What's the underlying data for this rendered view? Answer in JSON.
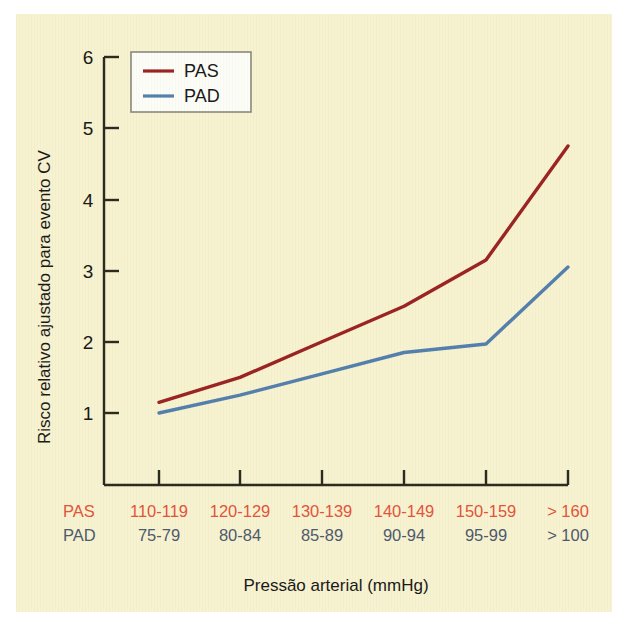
{
  "chart_data": {
    "type": "line",
    "title": "",
    "xlabel": "Pressão arterial (mmHg)",
    "ylabel": "Risco relativo ajustado para evento CV",
    "categories": [
      "110-119",
      "120-129",
      "130-139",
      "140-149",
      "150-159",
      "> 160"
    ],
    "categories_secondary": [
      "75-79",
      "80-84",
      "85-89",
      "90-94",
      "95-99",
      "> 100"
    ],
    "category_row_labels": {
      "primary": "PAS",
      "secondary": "PAD"
    },
    "series": [
      {
        "name": "PAS",
        "color": "#9B2424",
        "values": [
          1.15,
          1.5,
          2.0,
          2.5,
          3.15,
          4.75
        ]
      },
      {
        "name": "PAD",
        "color": "#5580AE",
        "values": [
          1.0,
          1.25,
          1.55,
          1.85,
          1.97,
          3.05
        ]
      }
    ],
    "yticks": [
      1,
      2,
      3,
      4,
      5,
      6
    ],
    "ytick_labels": [
      "1",
      "2",
      "3",
      "4",
      "5",
      "6"
    ],
    "ylim": [
      0.0,
      6.0
    ],
    "grid": false,
    "legend_position": "top-left",
    "legend_entries": [
      "PAS",
      "PAD"
    ]
  },
  "axis": {
    "y_tick_1": "1",
    "y_tick_2": "2",
    "y_tick_3": "3",
    "y_tick_4": "4",
    "y_tick_5": "5",
    "y_tick_6": "6",
    "y_title": "Risco relativo ajustado para evento CV",
    "x_title": "Pressão arterial (mmHg)"
  },
  "xlabels": {
    "pas_row_label": "PAS",
    "pad_row_label": "PAD",
    "pas": [
      "110-119",
      "120-129",
      "130-139",
      "140-149",
      "150-159",
      "> 160"
    ],
    "pad": [
      "75-79",
      "80-84",
      "85-89",
      "90-94",
      "95-99",
      "> 100"
    ]
  },
  "legend": {
    "item1": "PAS",
    "item2": "PAD"
  },
  "colors": {
    "background": "#f7f2cf",
    "page": "#ffffff",
    "pas_line": "#9B2424",
    "pad_line": "#5580AE",
    "pas_label": "#E3553C",
    "pad_label": "#4E5A6E",
    "axis": "#2b2b20",
    "legend_box_fill": "#fdfdf8",
    "legend_box_border": "#8a8a7a",
    "text": "#1a1a1a"
  }
}
